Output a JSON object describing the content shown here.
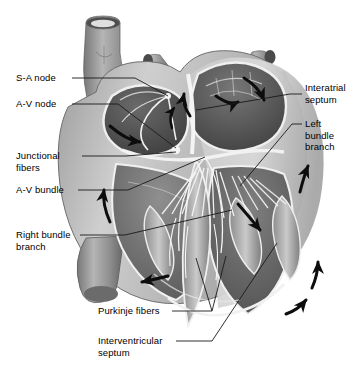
{
  "figure": {
    "view": "coronal section, anterior view",
    "style": "grayscale anatomical illustration"
  },
  "palette": {
    "background": "#ffffff",
    "label_text": "#000000",
    "leader_line": "#1a1a1a",
    "arrow": "#0d0d0d",
    "muscle_light": "#d8d8d8",
    "muscle_mid": "#a8a8a8",
    "muscle_dark": "#6f6f6f",
    "cavity_dark": "#4a4a4a",
    "cavity_darker": "#3a3a3a",
    "vessel_gray": "#8a8a8a",
    "endocardium_white": "#f2f2f2"
  },
  "labels": [
    {
      "id": "sa-node",
      "text": "S-A node",
      "lines": [
        "S-A node"
      ],
      "x": 16,
      "y": 72,
      "side": "left",
      "leader": [
        [
          72,
          78
        ],
        [
          135,
          78
        ],
        [
          168,
          96
        ]
      ]
    },
    {
      "id": "av-node",
      "text": "A-V node",
      "lines": [
        "A-V node"
      ],
      "x": 16,
      "y": 98,
      "side": "left",
      "leader": [
        [
          72,
          104
        ],
        [
          118,
          104
        ],
        [
          176,
          148
        ]
      ]
    },
    {
      "id": "junctional-fibers",
      "text": "Junctional fibers",
      "lines": [
        "Junctional",
        "fibers"
      ],
      "x": 16,
      "y": 150,
      "side": "left",
      "leader": [
        [
          82,
          156
        ],
        [
          126,
          156
        ],
        [
          176,
          152
        ]
      ]
    },
    {
      "id": "av-bundle",
      "text": "A-V bundle",
      "lines": [
        "A-V bundle"
      ],
      "x": 16,
      "y": 184,
      "side": "left",
      "leader": [
        [
          78,
          190
        ],
        [
          128,
          190
        ],
        [
          205,
          157
        ]
      ]
    },
    {
      "id": "right-bundle-branch",
      "text": "Right bundle branch",
      "lines": [
        "Right bundle",
        "branch"
      ],
      "x": 16,
      "y": 229,
      "side": "left",
      "leader": [
        [
          80,
          235
        ],
        [
          125,
          235
        ],
        [
          232,
          210
        ]
      ]
    },
    {
      "id": "interatrial-septum",
      "text": "Interatrial septum",
      "lines": [
        "Interatrial",
        "septum"
      ],
      "x": 305,
      "y": 88,
      "side": "right",
      "leader": [
        [
          302,
          94
        ],
        [
          290,
          94
        ],
        [
          196,
          110
        ]
      ]
    },
    {
      "id": "left-bundle-branch",
      "text": "Left bundle branch",
      "lines": [
        "Left",
        "bundle",
        "branch"
      ],
      "x": 305,
      "y": 118,
      "side": "right",
      "leader": [
        [
          302,
          124
        ],
        [
          292,
          124
        ],
        [
          240,
          186
        ]
      ]
    },
    {
      "id": "purkinje-fibers",
      "text": "Purkinje fibers",
      "lines": [
        "Purkinje fibers"
      ],
      "x": 98,
      "y": 305,
      "side": "left",
      "leader": [
        [
          172,
          311
        ],
        [
          212,
          311
        ],
        [
          196,
          258
        ]
      ]
    },
    {
      "id": "interventricular-septum",
      "text": "Interventricular septum",
      "lines": [
        "Interventricular",
        "septum"
      ],
      "x": 98,
      "y": 335,
      "side": "left",
      "leader": [
        [
          176,
          341
        ],
        [
          212,
          341
        ],
        [
          277,
          243
        ]
      ]
    }
  ],
  "structures": [
    {
      "id": "superior-vena-cava",
      "name": "superior vena cava"
    },
    {
      "id": "pulmonary-veins",
      "name": "pulmonary vein stumps"
    },
    {
      "id": "right-atrium",
      "name": "right atrium cavity"
    },
    {
      "id": "left-atrium",
      "name": "left atrium cavity"
    },
    {
      "id": "right-ventricle",
      "name": "right ventricle cavity"
    },
    {
      "id": "left-ventricle",
      "name": "left ventricle cavity"
    },
    {
      "id": "inferior-vena-cava",
      "name": "inferior vena cava"
    },
    {
      "id": "myocardium",
      "name": "myocardial wall"
    },
    {
      "id": "papillary-muscles",
      "name": "papillary muscles"
    },
    {
      "id": "chordae-tendineae",
      "name": "chordae tendineae"
    },
    {
      "id": "apex",
      "name": "cardiac apex"
    }
  ],
  "conduction_arrows": [
    {
      "id": "arrow-ra-spread",
      "note": "impulse spreading across right atrium"
    },
    {
      "id": "arrow-la-spread-1",
      "note": "impulse spreading across left atrium"
    },
    {
      "id": "arrow-la-spread-2",
      "note": "impulse spreading across left atrium"
    },
    {
      "id": "arrow-la-up",
      "note": "impulse travelling up left atrial wall"
    },
    {
      "id": "arrow-septum-down",
      "note": "impulse descending interventricular septum"
    },
    {
      "id": "arrow-rv-up",
      "note": "impulse up right ventricular wall"
    },
    {
      "id": "arrow-rv-apex",
      "note": "impulse toward apex in right ventricle"
    },
    {
      "id": "arrow-lv-up",
      "note": "impulse up left ventricular wall"
    },
    {
      "id": "arrow-lv-curve-1",
      "note": "impulse curving around left ventricle"
    },
    {
      "id": "arrow-lv-curve-2",
      "note": "impulse curving around left ventricle"
    }
  ]
}
